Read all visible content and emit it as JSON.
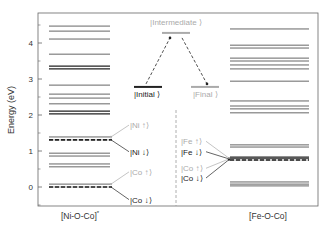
{
  "chart_data": {
    "type": "energy-level-diagram",
    "ylabel": "Energy (eV)",
    "ylim": [
      -0.53,
      4.8
    ],
    "yticks": [
      0,
      1,
      2,
      3,
      4
    ],
    "ytick_labels": [
      "0",
      "1",
      "2",
      "3",
      "4"
    ],
    "columns": [
      {
        "name": "[Ni-O-Co]*",
        "label": "[Ni-O-Co]",
        "superscript": "*",
        "levels": [
          {
            "e": 4.47,
            "style": "solid"
          },
          {
            "e": 4.33,
            "style": "solid"
          },
          {
            "e": 4.11,
            "style": "solid"
          },
          {
            "e": 3.69,
            "style": "solid"
          },
          {
            "e": 3.36,
            "style": "bold"
          },
          {
            "e": 3.28,
            "style": "bold"
          },
          {
            "e": 2.83,
            "style": "solid"
          },
          {
            "e": 2.58,
            "style": "solid"
          },
          {
            "e": 2.47,
            "style": "solid"
          },
          {
            "e": 2.31,
            "style": "solid"
          },
          {
            "e": 2.11,
            "style": "bold"
          },
          {
            "e": 2.03,
            "style": "bold"
          },
          {
            "e": 1.39,
            "style": "solid"
          },
          {
            "e": 1.31,
            "style": "dashed"
          },
          {
            "e": 0.94,
            "style": "solid"
          },
          {
            "e": 0.86,
            "style": "solid"
          },
          {
            "e": 0.64,
            "style": "solid"
          },
          {
            "e": 0.56,
            "style": "solid"
          },
          {
            "e": 0.08,
            "style": "solid"
          },
          {
            "e": 0.0,
            "style": "dashed"
          }
        ],
        "annotations": [
          {
            "text": "|Ni ↑⟩",
            "tone": "light",
            "target_e": 1.39,
            "text_e": 1.72
          },
          {
            "text": "|Ni ↓⟩",
            "tone": "dark",
            "target_e": 1.31,
            "text_e": 0.98
          },
          {
            "text": "|Co ↑⟩",
            "tone": "light",
            "target_e": 0.08,
            "text_e": 0.42
          },
          {
            "text": "|Co ↓⟩",
            "tone": "dark",
            "target_e": 0.0,
            "text_e": -0.35
          }
        ]
      },
      {
        "name": "[Fe-O-Co]",
        "label": "[Fe-O-Co]",
        "superscript": "",
        "levels": [
          {
            "e": 4.39,
            "style": "solid"
          },
          {
            "e": 3.94,
            "style": "solid"
          },
          {
            "e": 3.86,
            "style": "solid"
          },
          {
            "e": 3.58,
            "style": "solid"
          },
          {
            "e": 3.5,
            "style": "solid"
          },
          {
            "e": 3.39,
            "style": "solid"
          },
          {
            "e": 3.28,
            "style": "solid"
          },
          {
            "e": 2.94,
            "style": "solid"
          },
          {
            "e": 2.39,
            "style": "solid"
          },
          {
            "e": 2.25,
            "style": "solid"
          },
          {
            "e": 2.17,
            "style": "solid"
          },
          {
            "e": 2.06,
            "style": "solid"
          },
          {
            "e": 1.17,
            "style": "solid"
          },
          {
            "e": 1.11,
            "style": "solid"
          },
          {
            "e": 0.83,
            "style": "bold"
          },
          {
            "e": 0.78,
            "style": "bold"
          },
          {
            "e": 0.75,
            "style": "dashed"
          },
          {
            "e": 0.14,
            "style": "solid"
          },
          {
            "e": 0.08,
            "style": "solid"
          },
          {
            "e": 0.03,
            "style": "solid"
          }
        ],
        "annotations": [
          {
            "text": "|Fe ↑⟩",
            "tone": "light",
            "target_e": 0.8,
            "text_e": 1.27
          },
          {
            "text": "|Fe ↓⟩",
            "tone": "dark",
            "target_e": 0.78,
            "text_e": 0.98
          },
          {
            "text": "|Co ↑⟩",
            "tone": "light",
            "target_e": 0.78,
            "text_e": 0.52
          },
          {
            "text": "|Co ↓⟩",
            "tone": "dark",
            "target_e": 0.76,
            "text_e": 0.25
          }
        ]
      }
    ],
    "inset": {
      "initial": {
        "label": "|Initial ⟩",
        "e": 2.78
      },
      "intermediate": {
        "label": "|Intermediate ⟩",
        "e": 4.28
      },
      "final": {
        "label": "|Final ⟩",
        "e": 2.78
      }
    }
  },
  "colors": {
    "dark": "#222222",
    "mid": "#555555",
    "light": "#aaaaaa",
    "frame": "#666666"
  }
}
